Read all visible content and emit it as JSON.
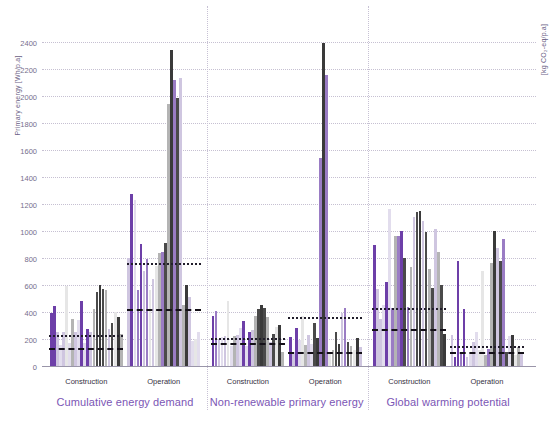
{
  "axes": {
    "left_title": "Primary energy [Wh/p.a]",
    "right_title": "[kg CO₂-eq/p.a]",
    "y_ticks": [
      0,
      200,
      400,
      600,
      800,
      1000,
      1200,
      1400,
      1600,
      1800,
      2000,
      2200,
      2400
    ],
    "y_min": 0,
    "y_max": 2500
  },
  "colors": {
    "accent_purple": "#7b56b5",
    "dark_purple": "#6d3fa8",
    "mid_purple": "#9a7cc4",
    "light_lavender": "#cfc6e0",
    "pale_lavender": "#e2dded",
    "pale_gray": "#e6e6e6",
    "mid_gray": "#b4b4b4",
    "dark_gray": "#4a4a4a",
    "darkest": "#3a3a3a",
    "gridline": "#bdb6cb",
    "label_text": "#36313f",
    "tick_text": "#5d5478"
  },
  "groups": [
    {
      "name": "Cumulative energy demand",
      "label": "Cumulative energy demand",
      "sections": [
        {
          "name": "Construction",
          "label": "Construction"
        },
        {
          "name": "Operation",
          "label": "Operation"
        }
      ]
    },
    {
      "name": "Non-renewable primary energy",
      "label": "Non-renewable primary energy",
      "sections": [
        {
          "name": "Construction",
          "label": "Construction"
        },
        {
          "name": "Operation",
          "label": "Operation"
        }
      ]
    },
    {
      "name": "Global warming potential",
      "label": "Global warming potential",
      "sections": [
        {
          "name": "Construction",
          "label": "Construction"
        },
        {
          "name": "Operation",
          "label": "Operation"
        }
      ]
    }
  ],
  "chart_data": {
    "type": "bar",
    "title": "",
    "xlabel": "",
    "ylabel": "Primary energy [Wh/p.a]",
    "ylabel_right": "[kg CO₂-eq/p.a]",
    "ylim": [
      0,
      2500
    ],
    "yticks": [
      0,
      200,
      400,
      600,
      800,
      1000,
      1200,
      1400,
      1600,
      1800,
      2000,
      2200,
      2400
    ],
    "grid": true,
    "legend": "none",
    "palette_cycle": [
      "dark_purple",
      "mid_purple",
      "light_lavender",
      "pale_lavender",
      "pale_gray",
      "mid_gray",
      "dark_gray",
      "darkest"
    ],
    "clusters": [
      {
        "group": "Cumulative energy demand",
        "section": "Construction",
        "x_start": 12,
        "values": [
          390,
          445,
          255,
          155,
          250,
          590,
          170,
          345,
          250,
          340,
          480,
          170,
          275,
          250,
          420,
          545,
          600,
          570,
          560,
          275,
          315,
          400,
          365,
          235
        ],
        "colors": [
          "dark_purple",
          "dark_purple",
          "light_lavender",
          "pale_lavender",
          "light_lavender",
          "pale_gray",
          "pale_lavender",
          "mid_gray",
          "light_lavender",
          "pale_lavender",
          "dark_purple",
          "pale_lavender",
          "dark_purple",
          "light_lavender",
          "mid_gray",
          "dark_gray",
          "darkest",
          "dark_gray",
          "mid_gray",
          "light_lavender",
          "dark_gray",
          "pale_gray",
          "darkest",
          "mid_gray"
        ]
      },
      {
        "group": "Cumulative energy demand",
        "section": "Operation",
        "x_start": 128,
        "values": [
          800,
          1270,
          1230,
          560,
          905,
          700,
          790,
          560,
          640,
          740,
          835,
          845,
          910,
          1940,
          2335,
          2115,
          1985,
          2130,
          450,
          600,
          510,
          185,
          200,
          250
        ],
        "colors": [
          "light_lavender",
          "dark_purple",
          "pale_lavender",
          "mid_purple",
          "dark_purple",
          "light_lavender",
          "mid_purple",
          "pale_gray",
          "light_lavender",
          "pale_gray",
          "mid_gray",
          "mid_purple",
          "dark_gray",
          "mid_gray",
          "darkest",
          "mid_purple",
          "dark_gray",
          "light_lavender",
          "mid_gray",
          "darkest",
          "light_lavender",
          "pale_lavender",
          "pale_gray",
          "pale_lavender"
        ]
      },
      {
        "group": "Non-renewable primary energy",
        "section": "Construction",
        "x_start": 254,
        "values": [
          370,
          405,
          200,
          215,
          220,
          480,
          145,
          225,
          230,
          280,
          330,
          150,
          250,
          270,
          370,
          420,
          450,
          430,
          360,
          175,
          235,
          290,
          300,
          100
        ],
        "colors": [
          "dark_purple",
          "mid_purple",
          "light_lavender",
          "pale_lavender",
          "light_lavender",
          "pale_gray",
          "pale_lavender",
          "mid_gray",
          "light_lavender",
          "pale_lavender",
          "dark_purple",
          "pale_lavender",
          "dark_purple",
          "light_lavender",
          "mid_gray",
          "dark_gray",
          "darkest",
          "dark_gray",
          "mid_gray",
          "light_lavender",
          "dark_gray",
          "pale_gray",
          "darkest",
          "mid_gray"
        ]
      },
      {
        "group": "Non-renewable primary energy",
        "section": "Operation",
        "x_start": 370,
        "values": [
          215,
          105,
          280,
          195,
          370,
          155,
          230,
          160,
          320,
          205,
          1535,
          2390,
          2155,
          100,
          120,
          250,
          160,
          395,
          430,
          175,
          145,
          120,
          205,
          140
        ],
        "colors": [
          "dark_purple",
          "light_lavender",
          "dark_purple",
          "pale_lavender",
          "pale_gray",
          "mid_gray",
          "light_lavender",
          "pale_lavender",
          "dark_gray",
          "darkest",
          "mid_purple",
          "darkest",
          "mid_purple",
          "pale_gray",
          "mid_gray",
          "dark_gray",
          "darkest",
          "light_lavender",
          "mid_purple",
          "dark_gray",
          "mid_gray",
          "pale_gray",
          "darkest",
          "light_lavender"
        ]
      },
      {
        "group": "Global warming potential",
        "section": "Construction",
        "x_start": 496,
        "values": [
          895,
          570,
          345,
          450,
          620,
          1160,
          430,
          960,
          960,
          1000,
          800,
          440,
          730,
          1100,
          1140,
          1150,
          1070,
          990,
          720,
          580,
          1010,
          840,
          600,
          235
        ],
        "colors": [
          "dark_purple",
          "light_lavender",
          "light_lavender",
          "pale_lavender",
          "dark_purple",
          "pale_lavender",
          "mid_purple",
          "mid_gray",
          "mid_purple",
          "dark_purple",
          "dark_gray",
          "mid_purple",
          "mid_gray",
          "light_lavender",
          "dark_gray",
          "darkest",
          "light_lavender",
          "dark_gray",
          "mid_gray",
          "dark_gray",
          "light_lavender",
          "mid_gray",
          "dark_gray",
          "darkest"
        ]
      },
      {
        "group": "Global warming potential",
        "section": "Operation",
        "x_start": 612,
        "values": [
          230,
          65,
          775,
          95,
          425,
          70,
          100,
          180,
          250,
          115,
          700,
          85,
          125,
          760,
          995,
          870,
          780,
          940,
          105,
          225,
          230,
          80,
          140,
          95
        ],
        "colors": [
          "light_lavender",
          "dark_purple",
          "dark_purple",
          "mid_purple",
          "dark_purple",
          "light_lavender",
          "pale_lavender",
          "light_lavender",
          "pale_lavender",
          "pale_gray",
          "pale_gray",
          "mid_gray",
          "mid_purple",
          "mid_gray",
          "darkest",
          "light_lavender",
          "dark_gray",
          "mid_purple",
          "dark_gray",
          "pale_lavender",
          "darkest",
          "pale_gray",
          "mid_gray",
          "light_lavender"
        ]
      }
    ],
    "reference_lines": [
      {
        "group": "Cumulative energy demand",
        "section": "Construction",
        "style": "dotted",
        "value": 230
      },
      {
        "group": "Cumulative energy demand",
        "section": "Construction",
        "style": "dashed",
        "value": 130
      },
      {
        "group": "Cumulative energy demand",
        "section": "Operation",
        "style": "dotted",
        "value": 760
      },
      {
        "group": "Cumulative energy demand",
        "section": "Operation",
        "style": "dashed",
        "value": 425
      },
      {
        "group": "Non-renewable primary energy",
        "section": "Construction",
        "style": "dotted",
        "value": 205
      },
      {
        "group": "Non-renewable primary energy",
        "section": "Construction",
        "style": "dashed",
        "value": 170
      },
      {
        "group": "Non-renewable primary energy",
        "section": "Operation",
        "style": "dotted",
        "value": 365
      },
      {
        "group": "Non-renewable primary energy",
        "section": "Operation",
        "style": "dashed",
        "value": 105
      },
      {
        "group": "Global warming potential",
        "section": "Construction",
        "style": "dotted",
        "value": 430
      },
      {
        "group": "Global warming potential",
        "section": "Construction",
        "style": "dashed",
        "value": 270
      },
      {
        "group": "Global warming potential",
        "section": "Operation",
        "style": "dotted",
        "value": 145
      },
      {
        "group": "Global warming potential",
        "section": "Operation",
        "style": "dashed",
        "value": 105
      }
    ]
  }
}
